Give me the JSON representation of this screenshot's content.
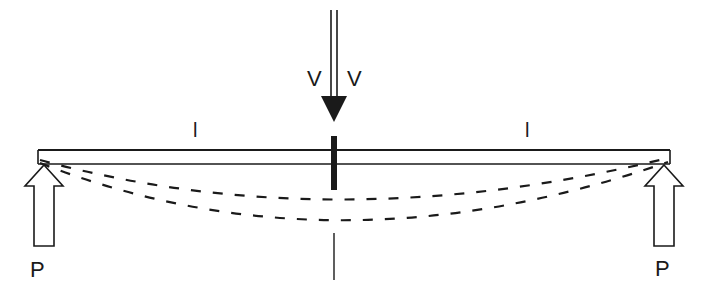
{
  "diagram": {
    "type": "simply-supported beam with central load and deflection curves",
    "labels": {
      "load_left": "V",
      "load_right": "V",
      "span_left": "l",
      "span_right": "l",
      "support_left": "P",
      "support_right": "P"
    },
    "colors": {
      "stroke": "#1a1a1a",
      "background": "#ffffff"
    },
    "elements": {
      "beam": "horizontal beam",
      "load_arrow": "downward applied load at midspan",
      "support_arrows": "upward reaction arrows at both ends",
      "deflection_curves": 2,
      "center_axis": "vertical symmetry line"
    }
  }
}
